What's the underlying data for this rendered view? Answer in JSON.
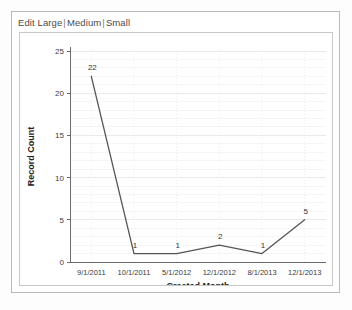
{
  "toolbar": {
    "edit_label": "Edit",
    "large_label": "Large",
    "medium_label": "Medium",
    "small_label": "Small",
    "separator": "|"
  },
  "colors": {
    "line": "#555555",
    "axis": "#6b6b6b",
    "gridline": "#e6e6ee",
    "panel_border": "#c8c8c8",
    "card_border": "#b9b9b9",
    "text": "#333333",
    "background": "#ffffff"
  },
  "chart_data": {
    "type": "line",
    "title": "",
    "xlabel": "Created Month",
    "ylabel": "Record Count",
    "categories": [
      "9/1/2011",
      "10/1/2011",
      "5/1/2012",
      "12/1/2012",
      "8/1/2013",
      "12/1/2013"
    ],
    "values": [
      22,
      1,
      1,
      2,
      1,
      5
    ],
    "point_labels": [
      "22",
      "1",
      "1",
      "2",
      "1",
      "5"
    ],
    "yticks": [
      0,
      5,
      10,
      15,
      20,
      25
    ],
    "ytick_labels": [
      "0",
      "5",
      "10",
      "15",
      "20",
      "25"
    ],
    "ylim": [
      0,
      25
    ],
    "grid": true,
    "legend": false,
    "markers": false,
    "series": [
      {
        "name": "Record Count",
        "values": [
          22,
          1,
          1,
          2,
          1,
          5
        ]
      }
    ]
  }
}
